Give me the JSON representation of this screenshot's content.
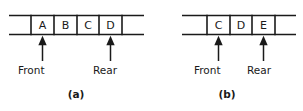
{
  "figure": {
    "background_color": "#ffffff",
    "line_color": "#1a1a1a",
    "text_color": "#1a1a1a"
  },
  "panels": [
    {
      "id": "a",
      "caption": "(a)",
      "cells": [
        {
          "label": ""
        },
        {
          "label": "A"
        },
        {
          "label": "B"
        },
        {
          "label": "C"
        },
        {
          "label": "D"
        },
        {
          "label": ""
        }
      ],
      "pointers": [
        {
          "name": "Front",
          "label": "Front",
          "cell_index": 1
        },
        {
          "name": "Rear",
          "label": "Rear",
          "cell_index": 4
        }
      ]
    },
    {
      "id": "b",
      "caption": "(b)",
      "cells": [
        {
          "label": ""
        },
        {
          "label": "C"
        },
        {
          "label": "D"
        },
        {
          "label": "E"
        },
        {
          "label": ""
        }
      ],
      "pointers": [
        {
          "name": "Front",
          "label": "Front",
          "cell_index": 1
        },
        {
          "name": "Rear",
          "label": "Rear",
          "cell_index": 3
        }
      ]
    }
  ]
}
